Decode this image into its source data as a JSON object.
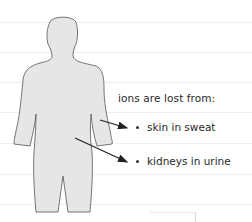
{
  "diagram": {
    "heading": "ions are lost from:",
    "items": [
      {
        "label": "skin in sweat",
        "icon": "bullet-icon"
      },
      {
        "label": "kidneys in urine",
        "icon": "bullet-icon"
      }
    ],
    "figure": "human-body-silhouette",
    "colors": {
      "body_fill": "#e6e6e6",
      "body_outline": "#555555",
      "arrow": "#222222",
      "rule_lines": "#efefef"
    }
  }
}
